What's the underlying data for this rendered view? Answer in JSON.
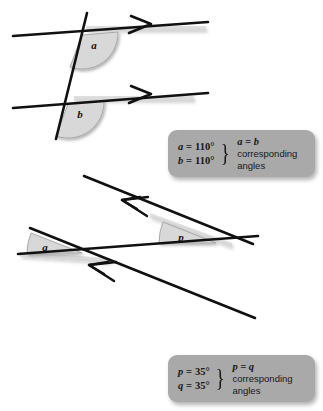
{
  "diagram": {
    "title": "Corresponding angles",
    "colors": {
      "line": "#111111",
      "angle_fill": "#d8d8d8",
      "angle_stroke": "#8e8e8e",
      "legend_bg": "#a9a9a9",
      "text": "#17181a",
      "background": "#ffffff"
    },
    "figures": [
      {
        "name": "upper-figure",
        "description": "Two parallel horizontal lines marked with single arrowheads, cut by a steep transversal; obtuse corresponding angles a and b marked.",
        "parallel_marks": "single-arrow",
        "angles": [
          {
            "label": "a",
            "value": "110°",
            "type": "obtuse"
          },
          {
            "label": "b",
            "value": "110°",
            "type": "obtuse"
          }
        ]
      },
      {
        "name": "lower-figure",
        "description": "Two parallel sloping lines marked with double arrowheads, cut by a transversal; acute corresponding angles p and q marked.",
        "parallel_marks": "double-arrow",
        "angles": [
          {
            "label": "p",
            "value": "35°",
            "type": "acute"
          },
          {
            "label": "q",
            "value": "35°",
            "type": "acute"
          }
        ]
      }
    ]
  },
  "legends": [
    {
      "name": "legend-angles-a-b",
      "equations": [
        {
          "var": "a",
          "rest": " = 110°"
        },
        {
          "var": "b",
          "rest": " = 110°"
        }
      ],
      "brace": "}",
      "relation": "a = b",
      "note_line_1": "corresponding",
      "note_line_2": "angles"
    },
    {
      "name": "legend-angles-p-q",
      "equations": [
        {
          "var": "p",
          "rest": " = 35°"
        },
        {
          "var": "q",
          "rest": " = 35°"
        }
      ],
      "brace": "}",
      "relation": "p = q",
      "note_line_1": "corresponding",
      "note_line_2": "angles"
    }
  ]
}
